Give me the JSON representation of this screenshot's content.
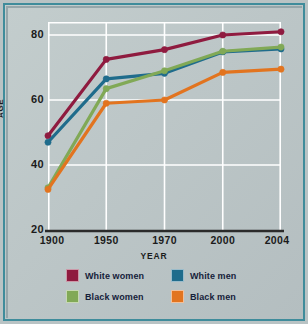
{
  "chart_data": {
    "type": "line",
    "title": "",
    "xlabel": "YEAR",
    "ylabel": "AGE",
    "categories": [
      "1900",
      "1950",
      "1970",
      "2000",
      "2004"
    ],
    "x": [
      1900,
      1950,
      1970,
      2000,
      2004
    ],
    "ylim": [
      20,
      84
    ],
    "yticks": [
      80,
      60,
      40,
      20
    ],
    "grid": true,
    "legend_position": "bottom",
    "series": [
      {
        "name": "White women",
        "color": "#8f1b3f",
        "values": [
          49,
          72.5,
          75.5,
          80,
          81
        ]
      },
      {
        "name": "White men",
        "color": "#1f6c8c",
        "values": [
          47,
          66.5,
          68.2,
          74.8,
          75.7
        ]
      },
      {
        "name": "Black women",
        "color": "#81a956",
        "values": [
          33,
          63.5,
          69,
          75,
          76.3
        ]
      },
      {
        "name": "Black men",
        "color": "#e2741f",
        "values": [
          32.5,
          59,
          60,
          68.5,
          69.5
        ]
      }
    ]
  },
  "axes": {
    "y_tick_labels": [
      "80",
      "60",
      "40",
      "20"
    ],
    "x_tick_labels": [
      "1900",
      "1950",
      "1970",
      "2000",
      "2004"
    ],
    "y_axis_title": "AGE",
    "x_axis_title": "YEAR"
  },
  "legend": {
    "items": [
      {
        "label": "White women",
        "color": "#8f1b3f"
      },
      {
        "label": "White men",
        "color": "#1f6c8c"
      },
      {
        "label": "Black women",
        "color": "#81a956"
      },
      {
        "label": "Black men",
        "color": "#e2741f"
      }
    ]
  },
  "colors": {
    "background": "#bcc6c7",
    "frame_border": "#3f8c9b",
    "gridline": "#ffffff",
    "axis": "#2b2b2b",
    "text": "#1b1b1b",
    "legend_text": "#15213a"
  }
}
